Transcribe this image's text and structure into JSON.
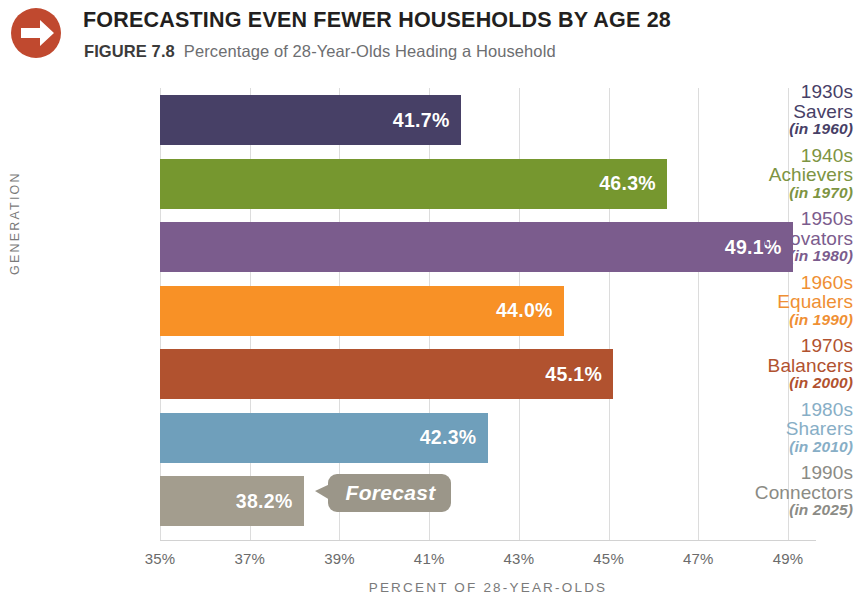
{
  "header": {
    "icon": "arrow-right-circle-icon",
    "icon_color": "#c0492f",
    "title": "FORECASTING EVEN FEWER HOUSEHOLDS BY AGE 28",
    "figure_number": "FIGURE 7.8",
    "subtitle": "Percentage of 28-Year-Olds Heading a Household"
  },
  "chart_data": {
    "type": "bar",
    "orientation": "horizontal",
    "title": "FORECASTING EVEN FEWER HOUSEHOLDS BY AGE 28",
    "subtitle": "Percentage of 28-Year-Olds Heading a Household",
    "xlabel": "PERCENT OF 28-YEAR-OLDS",
    "ylabel": "GENERATION",
    "xlim": [
      35,
      49.6
    ],
    "xticks": [
      35,
      37,
      39,
      41,
      43,
      45,
      47,
      49
    ],
    "xtick_labels": [
      "35%",
      "37%",
      "39%",
      "41%",
      "43%",
      "45%",
      "47%",
      "49%"
    ],
    "grid": true,
    "legend": "none",
    "categories": [
      "1930s Savers (in 1960)",
      "1940s Achievers (in 1970)",
      "1950s Innovators (in 1980)",
      "1960s Equalers (in 1990)",
      "1970s Balancers (in 2000)",
      "1980s Sharers (in 2010)",
      "1990s Connectors (in 2025)"
    ],
    "values": [
      41.7,
      46.3,
      49.1,
      44.0,
      45.1,
      42.3,
      38.2
    ],
    "value_labels": [
      "41.7%",
      "46.3%",
      "49.1%",
      "44.0%",
      "45.1%",
      "42.3%",
      "38.2%"
    ],
    "colors": [
      "#474066",
      "#76972f",
      "#7b5c8d",
      "#f89126",
      "#b1522f",
      "#6f9fbb",
      "#a39d8e"
    ],
    "annotations": [
      {
        "text": "Forecast",
        "attached_to": "1990s Connectors (in 2025)"
      }
    ]
  },
  "bars": [
    {
      "decade": "1930s",
      "name": "Savers",
      "year": "(in 1960)",
      "value": 41.7,
      "value_label": "41.7%",
      "color": "#474066",
      "label_color": "#474066"
    },
    {
      "decade": "1940s",
      "name": "Achievers",
      "year": "(in 1970)",
      "value": 46.3,
      "value_label": "46.3%",
      "color": "#76972f",
      "label_color": "#7d9442"
    },
    {
      "decade": "1950s",
      "name": "Innovators",
      "year": "(in 1980)",
      "value": 49.1,
      "value_label": "49.1%",
      "color": "#7b5c8d",
      "label_color": "#7b5c8d"
    },
    {
      "decade": "1960s",
      "name": "Equalers",
      "year": "(in 1990)",
      "value": 44.0,
      "value_label": "44.0%",
      "color": "#f89126",
      "label_color": "#ef8f33"
    },
    {
      "decade": "1970s",
      "name": "Balancers",
      "year": "(in 2000)",
      "value": 45.1,
      "value_label": "45.1%",
      "color": "#b1522f",
      "label_color": "#b1522f"
    },
    {
      "decade": "1980s",
      "name": "Sharers",
      "year": "(in 2010)",
      "value": 42.3,
      "value_label": "42.3%",
      "color": "#6f9fbb",
      "label_color": "#87aec6"
    },
    {
      "decade": "1990s",
      "name": "Connectors",
      "year": "(in 2025)",
      "value": 38.2,
      "value_label": "38.2%",
      "color": "#a39d8e",
      "label_color": "#8b8b85"
    }
  ],
  "axes": {
    "x_title": "PERCENT OF 28-YEAR-OLDS",
    "y_title": "GENERATION",
    "ticks": [
      "35%",
      "37%",
      "39%",
      "41%",
      "43%",
      "45%",
      "47%",
      "49%"
    ],
    "tick_values": [
      35,
      37,
      39,
      41,
      43,
      45,
      47,
      49
    ]
  },
  "callout": {
    "label": "Forecast",
    "color": "#9b9689"
  }
}
